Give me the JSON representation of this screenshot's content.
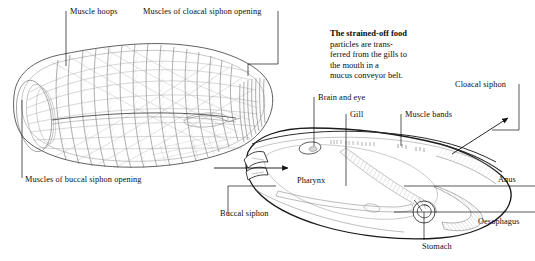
{
  "figure": {
    "background_color": "#ffffff",
    "ink_color": "#111111"
  },
  "caption": {
    "bold_lead": "The strained-off food",
    "lines": [
      "particles are trans-",
      "ferred from the gills to",
      "the mouth in a",
      "mucus conveyor belt."
    ],
    "full_text": "The strained-off food particles are transferred from the gills to the mouth in a mucus conveyor belt."
  },
  "left_diagram": {
    "name": "muscle-network-diagram",
    "labels": [
      {
        "id": "muscle-hoops",
        "text": "Muscle hoops",
        "x": 70,
        "y": 8
      },
      {
        "id": "muscles-of-cloacal-siphon-opening",
        "text": "Muscles of cloacal siphon opening",
        "x": 143,
        "y": 8
      },
      {
        "id": "muscles-of-buccal-siphon-opening",
        "text": "Muscles of buccal siphon opening",
        "x": 25,
        "y": 176
      }
    ]
  },
  "right_diagram": {
    "name": "internal-anatomy-diagram",
    "labels": [
      {
        "id": "brain-and-eye",
        "text": "Brain and eye",
        "x": 318,
        "y": 94
      },
      {
        "id": "gill",
        "text": "Gill",
        "x": 350,
        "y": 111
      },
      {
        "id": "muscle-bands",
        "text": "Muscle bands",
        "x": 405,
        "y": 111
      },
      {
        "id": "cloacal-siphon",
        "text": "Cloacal siphon",
        "x": 455,
        "y": 81
      },
      {
        "id": "pharynx",
        "text": "Pharynx",
        "x": 297,
        "y": 177
      },
      {
        "id": "buccal-siphon",
        "text": "Buccal siphon",
        "x": 220,
        "y": 210
      },
      {
        "id": "anus",
        "text": "Anus",
        "x": 498,
        "y": 176
      },
      {
        "id": "oesophagus",
        "text": "Oesophagus",
        "x": 478,
        "y": 218
      },
      {
        "id": "stomach",
        "text": "Stomach",
        "x": 422,
        "y": 243
      }
    ],
    "flow_arrows": [
      {
        "id": "inflow-arrow",
        "direction": "right",
        "description": "water entering buccal siphon"
      },
      {
        "id": "outflow-arrow",
        "direction": "up-right",
        "description": "water exiting cloacal siphon"
      }
    ]
  }
}
